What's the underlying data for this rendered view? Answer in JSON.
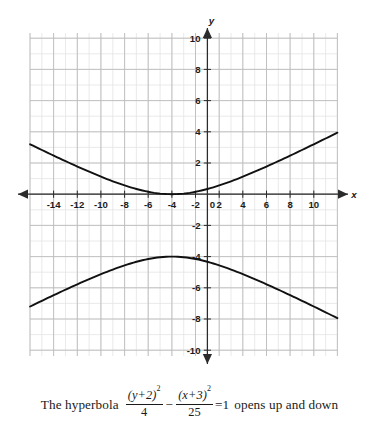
{
  "figure": {
    "title": "",
    "axis_labels": {
      "x": "x",
      "y": "y"
    },
    "origin_label": "0",
    "x_tick_labels": [
      "-14",
      "-12",
      "-10",
      "-8",
      "-6",
      "-4",
      "-2",
      "2",
      "4",
      "6",
      "8",
      "10"
    ],
    "y_tick_labels": [
      "10",
      "8",
      "6",
      "4",
      "2",
      "-2",
      "-4",
      "-6",
      "-8",
      "-10"
    ],
    "colors": {
      "curve": "#111111",
      "axis": "#2b2b2b",
      "grid_major": "#b9b9b9",
      "grid_minor": "#e2e2e2",
      "background": "#ffffff",
      "text": "#1c1c1c"
    }
  },
  "caption": {
    "lead": "The hyperbola",
    "term1": {
      "numerator": "(y+2)",
      "numerator_exponent": "2",
      "denominator": "4"
    },
    "operator": "−",
    "term2": {
      "numerator": "(x+3)",
      "numerator_exponent": "2",
      "denominator": "25"
    },
    "equals": "=1",
    "tail": "opens up and down"
  },
  "chart_data": {
    "type": "line",
    "title": "",
    "xlabel": "x",
    "ylabel": "y",
    "xlim": [
      -15,
      11
    ],
    "ylim": [
      -10.8,
      10.5
    ],
    "grid": true,
    "grid_minor_step": 1,
    "grid_major_step": 2,
    "legend": "none",
    "equation": "(y+2)^2/4 - (x+3)^2/25 = 1",
    "center": [
      -3,
      -2
    ],
    "a": 2,
    "b": 5,
    "vertices": [
      [
        -3,
        0
      ],
      [
        -3,
        -4
      ]
    ],
    "opens": "up and down",
    "series": [
      {
        "name": "upper branch",
        "x": [
          -15,
          -14,
          -13,
          -12,
          -11,
          -10,
          -9,
          -8,
          -7,
          -6,
          -5,
          -4,
          -3,
          -2,
          -1,
          0,
          1,
          2,
          3,
          4,
          5,
          6,
          7,
          8,
          9,
          10,
          11
        ],
        "y": [
          3.26,
          2.95,
          2.65,
          2.35,
          2.06,
          1.78,
          1.52,
          1.27,
          1.04,
          0.83,
          0.66,
          0.53,
          0.45,
          0.53,
          0.66,
          0.83,
          1.04,
          1.27,
          1.52,
          1.78,
          2.06,
          2.35,
          2.65,
          2.95,
          3.26,
          3.58,
          3.9
        ]
      },
      {
        "name": "lower branch",
        "x": [
          -15,
          -14,
          -13,
          -12,
          -11,
          -10,
          -9,
          -8,
          -7,
          -6,
          -5,
          -4,
          -3,
          -2,
          -1,
          0,
          1,
          2,
          3,
          4,
          5,
          6,
          7,
          8,
          9,
          10,
          11
        ],
        "y": [
          -7.26,
          -6.95,
          -6.65,
          -6.35,
          -6.06,
          -5.78,
          -5.52,
          -5.27,
          -5.04,
          -4.83,
          -4.66,
          -4.53,
          -4.45,
          -4.53,
          -4.66,
          -4.83,
          -5.04,
          -5.27,
          -5.52,
          -5.78,
          -6.06,
          -6.35,
          -6.65,
          -6.95,
          -7.26,
          -7.58,
          -7.9
        ]
      }
    ]
  }
}
